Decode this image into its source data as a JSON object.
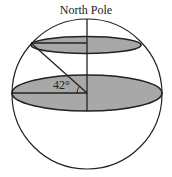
{
  "diagram": {
    "title": "North Pole",
    "angle_label": "42°",
    "colors": {
      "stroke": "#222222",
      "fill_shaded": "#a8a8a8",
      "background": "#ffffff"
    },
    "elements": [
      "sphere outline",
      "equatorial plane (shaded ellipse)",
      "latitude circle plane at 42° (shaded ellipse)",
      "polar axis",
      "radius to latitude circle",
      "angle arc 42°"
    ]
  }
}
